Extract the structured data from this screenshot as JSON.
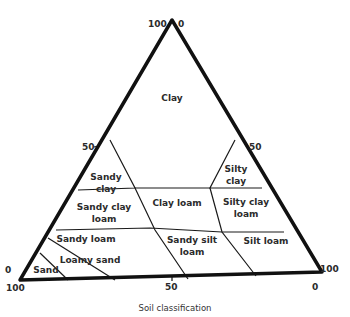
{
  "caption": "Soil classification",
  "ticks": {
    "top_left": "100",
    "top_right": "0",
    "left_mid": "50",
    "right_mid": "50",
    "left_bottom_side": "0",
    "left_bottom_below": "100",
    "bottom_mid": "50",
    "right_bottom_side": "100",
    "right_bottom_below": "0"
  },
  "regions": {
    "clay": "Clay",
    "sandy_clay_1": "Sandy",
    "sandy_clay_2": "clay",
    "silty_clay_1": "Silty",
    "silty_clay_2": "clay",
    "sandy_clay_loam_1": "Sandy clay",
    "sandy_clay_loam_2": "loam",
    "clay_loam": "Clay loam",
    "silty_clay_loam_1": "Silty clay",
    "silty_clay_loam_2": "loam",
    "sandy_loam": "Sandy loam",
    "loamy_sand": "Loamy sand",
    "sand": "Sand",
    "sandy_silt_loam_1": "Sandy silt",
    "sandy_silt_loam_2": "loam",
    "silt_loam": "Silt loam"
  },
  "colors": {
    "outline": "#111111",
    "text": "#2b2b2b",
    "background": "#ffffff"
  }
}
